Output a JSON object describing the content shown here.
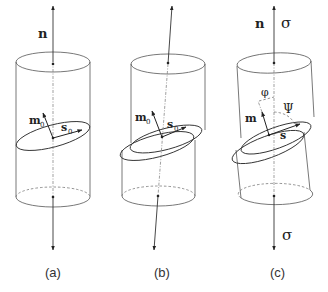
{
  "figure": {
    "panels": [
      {
        "id": "a",
        "caption": "(a)",
        "labels": {
          "axis": "n",
          "plane_normal": "m",
          "plane_normal_sub": "0",
          "slip_dir": "s",
          "slip_dir_sub": "0"
        }
      },
      {
        "id": "b",
        "caption": "(b)",
        "labels": {
          "plane_normal": "m",
          "plane_normal_sub": "0",
          "slip_dir": "s",
          "slip_dir_sub": "0"
        }
      },
      {
        "id": "c",
        "caption": "(c)",
        "labels": {
          "axis": "n",
          "stress_top": "σ",
          "stress_bottom": "σ",
          "angle_phi": "φ",
          "angle_psi": "Ψ",
          "plane_normal": "m",
          "slip_dir": "s"
        }
      }
    ]
  }
}
